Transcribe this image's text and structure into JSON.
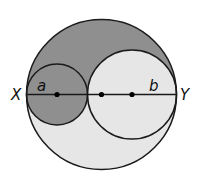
{
  "figure": {
    "labels": {
      "left_endpoint": "X",
      "right_endpoint": "Y",
      "small_circle": "a",
      "medium_circle": "b"
    },
    "colors": {
      "dark_shade": "#8f8f8f",
      "light_shade": "#e6e6e6",
      "stroke": "#1a1a1a",
      "background": "#ffffff"
    },
    "geometry": {
      "big_circle": {
        "cx": 101.5,
        "cy": 94.5,
        "r": 75
      },
      "circle_a": {
        "cx": 57,
        "cy": 94.5,
        "r": 30.5
      },
      "circle_b": {
        "cx": 132,
        "cy": 94.5,
        "r": 44.5
      },
      "diameter_y": 94.5,
      "points_x": [
        57,
        101.5,
        132
      ]
    }
  }
}
